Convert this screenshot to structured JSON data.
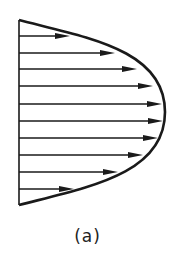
{
  "figure": {
    "type": "velocity-profile",
    "stroke_color": "#1a1a1a",
    "wall": {
      "x": 19,
      "y_top": 20,
      "y_bottom": 205
    },
    "curve": {
      "start": [
        19,
        20
      ],
      "apex": [
        165,
        112
      ],
      "end": [
        19,
        205
      ]
    },
    "arrows": [
      {
        "y": 36,
        "tip_x": 70
      },
      {
        "y": 53,
        "tip_x": 115
      },
      {
        "y": 69,
        "tip_x": 137
      },
      {
        "y": 86,
        "tip_x": 153
      },
      {
        "y": 104,
        "tip_x": 162
      },
      {
        "y": 121,
        "tip_x": 163
      },
      {
        "y": 138,
        "tip_x": 158
      },
      {
        "y": 155,
        "tip_x": 143
      },
      {
        "y": 172,
        "tip_x": 118
      },
      {
        "y": 189,
        "tip_x": 74
      }
    ]
  },
  "caption": "(a)"
}
